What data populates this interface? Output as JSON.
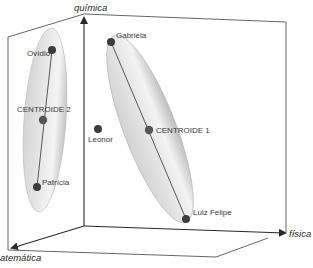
{
  "diagram": {
    "type": "3d-cluster-scatter",
    "axes": {
      "z_label": "química",
      "x_label": "física",
      "y_label": "matemática",
      "y_label_visible": "atemática"
    },
    "clusters": [
      {
        "name": "cluster-2",
        "centroid_label": "CENTROIDE 2",
        "members": [
          "Ovídio",
          "Patrícia"
        ]
      },
      {
        "name": "cluster-1",
        "centroid_label": "CENTROIDE 1",
        "members": [
          "Gabriela",
          "Luiz Felipe"
        ]
      }
    ],
    "points": [
      {
        "label": "Ovídio",
        "cluster": 2
      },
      {
        "label": "CENTROIDE 2",
        "cluster": 2,
        "centroid": true
      },
      {
        "label": "Patrícia",
        "cluster": 2
      },
      {
        "label": "Gabriela",
        "cluster": 1
      },
      {
        "label": "CENTROIDE 1",
        "cluster": 1,
        "centroid": true
      },
      {
        "label": "Luiz Felipe",
        "cluster": 1
      },
      {
        "label": "Leonor",
        "cluster": null
      }
    ],
    "labels": {
      "ovidio": "Ovídio",
      "centroide2": "CENTROIDE 2",
      "patricia": "Patrícia",
      "gabriela": "Gabriela",
      "leonor": "Leonor",
      "centroide1": "CENTROIDE 1",
      "luiz_felipe": "Luiz Felipe"
    },
    "colors": {
      "axis": "#2a2a2a",
      "box_edge": "#555555",
      "point": "#3c3c3c",
      "ellipse_fill": "#c9c9c9",
      "ellipse_edge": "#b5b5b5"
    }
  }
}
